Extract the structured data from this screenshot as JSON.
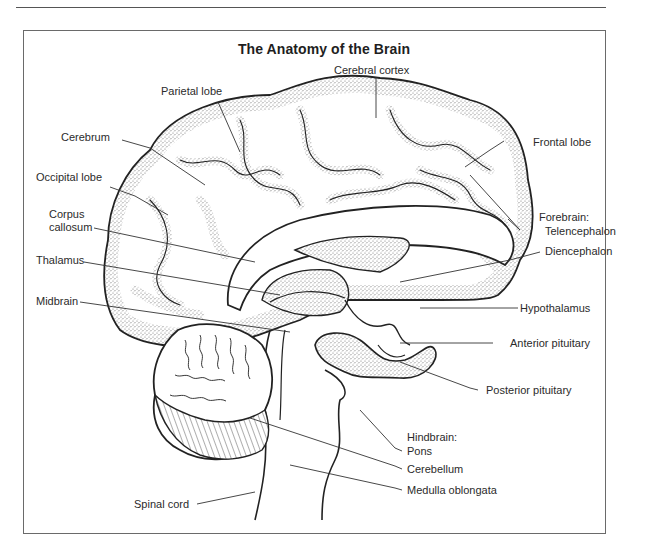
{
  "figure": {
    "title": "The Anatomy of the Brain",
    "colors": {
      "ink": "#2a2a2a",
      "stipple": "#8a8a8a",
      "frame": "#6a6a6a",
      "background": "#ffffff"
    }
  },
  "labels": {
    "cerebral_cortex": "Cerebral cortex",
    "parietal_lobe": "Parietal lobe",
    "frontal_lobe": "Frontal lobe",
    "cerebrum": "Cerebrum",
    "occipital_lobe": "Occipital lobe",
    "corpus_callosum_line1": "Corpus",
    "corpus_callosum_line2": "callosum",
    "forebrain": "Forebrain:",
    "telencephalon": "Telencephalon",
    "diencephalon": "Diencephalon",
    "thalamus": "Thalamus",
    "midbrain": "Midbrain",
    "hypothalamus": "Hypothalamus",
    "anterior_pituitary": "Anterior pituitary",
    "posterior_pituitary": "Posterior pituitary",
    "hindbrain": "Hindbrain:",
    "pons": "Pons",
    "cerebellum": "Cerebellum",
    "medulla_oblongata": "Medulla oblongata",
    "spinal_cord": "Spinal cord"
  }
}
